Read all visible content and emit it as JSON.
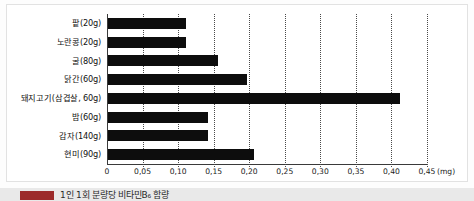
{
  "chart_data": {
    "type": "bar",
    "orientation": "horizontal",
    "title": "",
    "xlabel": "(mg)",
    "ylabel": "",
    "unit": "(mg)",
    "xlim": [
      0,
      0.45
    ],
    "grid": true,
    "legend": "none",
    "decimal_separator": ",",
    "tick_labels": [
      "0",
      "0,05",
      "0,10",
      "0,15",
      "0,20",
      "0,25",
      "0,30",
      "0,35",
      "0,40",
      "0,45"
    ],
    "tick_values": [
      0,
      0.05,
      0.1,
      0.15,
      0.2,
      0.25,
      0.3,
      0.35,
      0.4,
      0.45
    ],
    "categories": [
      "팥(20g)",
      "노란콩(20g)",
      "굴(80g)",
      "닭간(60g)",
      "돼지고기(삼겹살, 60g)",
      "밤(60g)",
      "감자(140g)",
      "현미(90g)"
    ],
    "values": [
      0.11,
      0.11,
      0.155,
      0.195,
      0.41,
      0.14,
      0.14,
      0.205
    ],
    "bar_color": "#0d0d0d"
  },
  "caption": {
    "text": "1인 1회 분량당 비타민B₆ 함량",
    "swatch_color": "#9c2a2a"
  }
}
